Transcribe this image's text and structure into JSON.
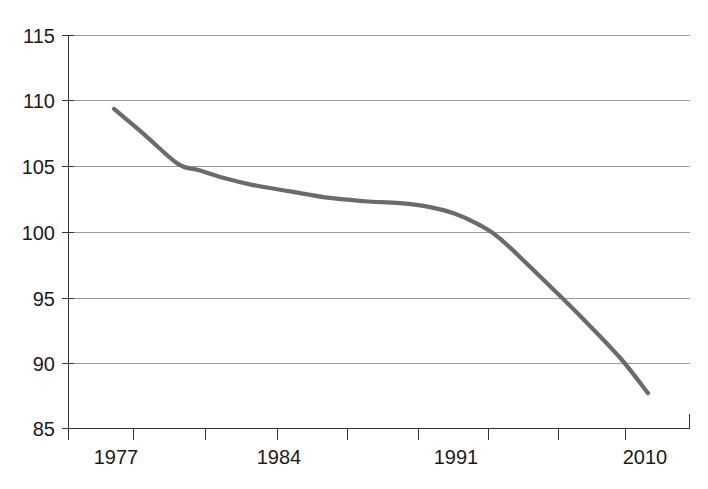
{
  "chart_data": {
    "type": "line",
    "title": "",
    "subtitle": "",
    "xlabel": "",
    "ylabel": "",
    "xlim": [
      1975,
      2012
    ],
    "ylim": [
      85,
      115
    ],
    "grid": true,
    "legend": false,
    "legend_position": "none",
    "line_color": "#6b6b6b",
    "grid_color": "#9a9a9a",
    "axis_color": "#333333",
    "label_color": "#1a1a1a",
    "y_ticks": [
      115,
      110,
      105,
      100,
      95,
      90,
      85
    ],
    "y_tick_labels": [
      "115",
      "110",
      "105",
      "100",
      "95",
      "90",
      "85"
    ],
    "x_tick_labels": [
      "1977",
      "1984",
      "1991",
      "2010"
    ],
    "x_tick_label_positions": [
      1977,
      1984,
      1991,
      2010
    ],
    "x_minor_tick_count": 10,
    "series": [
      {
        "name": "index",
        "x": [
          1977.0,
          1978.5,
          1980.0,
          1981.0,
          1982.5,
          1984.0,
          1986.0,
          1988.0,
          1989.5,
          1991.0,
          1992.5,
          1994.5,
          1997.0,
          2000.0,
          2003.0,
          2006.0,
          2009.0,
          2010.0
        ],
        "values": [
          109.4,
          107.4,
          105.2,
          104.7,
          104.1,
          103.5,
          103.0,
          102.5,
          102.3,
          102.2,
          101.9,
          101.3,
          100.2,
          98.6,
          96.4,
          93.9,
          91.3,
          87.7
        ]
      }
    ],
    "points_pixel": [
      [
        114,
        109.4
      ],
      [
        145,
        107.4
      ],
      [
        178,
        105.2
      ],
      [
        200,
        104.7
      ],
      [
        225,
        104.1
      ],
      [
        252,
        103.6
      ],
      [
        290,
        103.1
      ],
      [
        330,
        102.6
      ],
      [
        365,
        102.35
      ],
      [
        400,
        102.2
      ],
      [
        430,
        101.9
      ],
      [
        455,
        101.4
      ],
      [
        478,
        100.6
      ],
      [
        500,
        99.5
      ],
      [
        540,
        96.6
      ],
      [
        580,
        93.6
      ],
      [
        620,
        90.4
      ],
      [
        648,
        87.7
      ]
    ]
  },
  "axis": {
    "y_axis_name": "value-axis",
    "x_axis_name": "year-axis"
  }
}
